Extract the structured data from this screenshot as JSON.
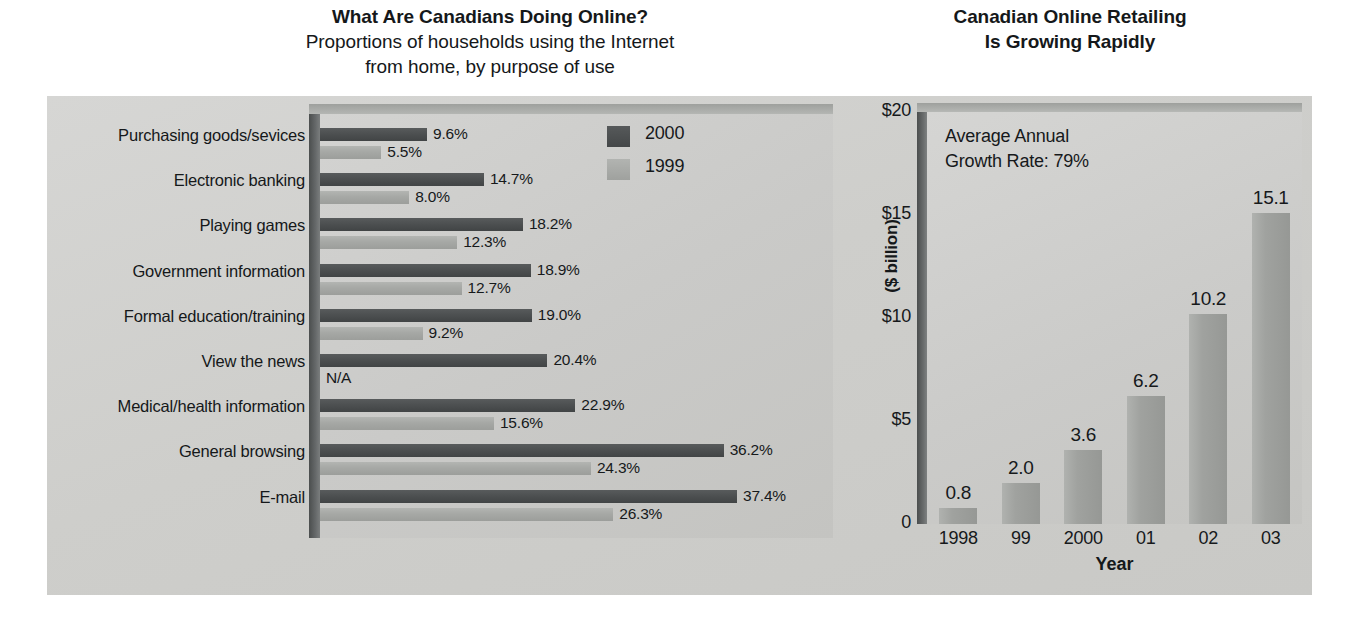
{
  "left": {
    "title": "What Are Canadians Doing Online?",
    "subtitle_line1": "Proportions of households using the Internet",
    "subtitle_line2": "from home, by purpose of use",
    "legend": [
      {
        "label": "2000",
        "color": "#4a4d4e"
      },
      {
        "label": "1999",
        "color": "#a6a8a5"
      }
    ]
  },
  "right": {
    "title_line1": "Canadian Online Retailing",
    "title_line2": "Is Growing Rapidly",
    "annotation_line1": "Average Annual",
    "annotation_line2": "Growth Rate: 79%",
    "ylabel": "($ billion)",
    "xlabel": "Year"
  },
  "chart_data": [
    {
      "type": "bar",
      "orientation": "horizontal",
      "title": "What Are Canadians Doing Online?",
      "subtitle": "Proportions of households using the Internet from home, by purpose of use",
      "xlabel": "",
      "ylabel": "",
      "categories": [
        "Purchasing goods/sevices",
        "Electronic banking",
        "Playing games",
        "Government information",
        "Formal education/training",
        "View the news",
        "Medical/health information",
        "General browsing",
        "E-mail"
      ],
      "series": [
        {
          "name": "2000",
          "color": "#4a4d4e",
          "values": [
            9.6,
            14.7,
            18.2,
            18.9,
            19.0,
            20.4,
            22.9,
            36.2,
            37.4
          ],
          "labels": [
            "9.6%",
            "14.7%",
            "18.2%",
            "18.9%",
            "19.0%",
            "20.4%",
            "22.9%",
            "36.2%",
            "37.4%"
          ]
        },
        {
          "name": "1999",
          "color": "#a6a8a5",
          "values": [
            5.5,
            8.0,
            12.3,
            12.7,
            9.2,
            null,
            15.6,
            24.3,
            26.3
          ],
          "labels": [
            "5.5%",
            "8.0%",
            "12.3%",
            "12.7%",
            "9.2%",
            "N/A",
            "15.6%",
            "24.3%",
            "26.3%"
          ]
        }
      ],
      "xlim": [
        0,
        40
      ],
      "grid": false,
      "legend_position": "top-right",
      "value_suffix": "%"
    },
    {
      "type": "bar",
      "orientation": "vertical",
      "title": "Canadian Online Retailing Is Growing Rapidly",
      "xlabel": "Year",
      "ylabel": "($ billion)",
      "categories": [
        "1998",
        "99",
        "2000",
        "01",
        "02",
        "03"
      ],
      "values": [
        0.8,
        2.0,
        3.6,
        6.2,
        10.2,
        15.1
      ],
      "labels": [
        "0.8",
        "2.0",
        "3.6",
        "6.2",
        "10.2",
        "15.1"
      ],
      "ylim": [
        0,
        20
      ],
      "yticks": [
        0,
        5,
        10,
        15,
        20
      ],
      "ytick_labels": [
        "0",
        "$5",
        "$10",
        "$15",
        "$20"
      ],
      "grid": false,
      "annotation": "Average Annual Growth Rate: 79%",
      "bar_color": "#9fa19e"
    }
  ]
}
